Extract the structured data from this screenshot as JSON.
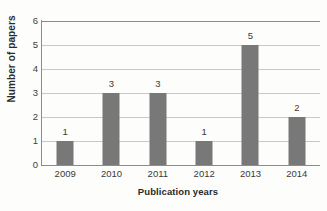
{
  "chart_data": {
    "type": "bar",
    "title": "",
    "xlabel": "Publication years",
    "ylabel": "Number of papers",
    "categories": [
      "2009",
      "2010",
      "2011",
      "2012",
      "2013",
      "2014"
    ],
    "values": [
      1,
      3,
      3,
      1,
      5,
      2
    ],
    "data_labels": [
      "1",
      "3",
      "3",
      "1",
      "5",
      "2"
    ],
    "ylim": [
      0,
      6
    ],
    "ytick_labels": [
      "0",
      "1",
      "2",
      "3",
      "4",
      "5",
      "6"
    ],
    "ytick_values": [
      0,
      1,
      2,
      3,
      4,
      5,
      6
    ],
    "grid": "horizontal",
    "legend": "none",
    "bar_color": "#787878",
    "gridline_color": "#c9c9c9",
    "axis_color": "#8c8c8c",
    "background_color": "#fdfdfb",
    "text_color": "#3a3a3a"
  }
}
